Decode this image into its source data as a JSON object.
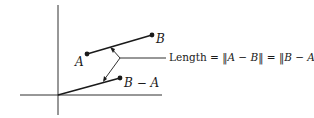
{
  "diagram": {
    "labels": {
      "point_a": "A",
      "point_b": "B",
      "difference": "B − A",
      "length_prefix": "Length = ",
      "norm_ab": "‖A − B‖",
      "equals": " = ",
      "norm_ba": "‖B − A‖"
    },
    "points": {
      "origin": [
        58,
        95
      ],
      "A": [
        87,
        54
      ],
      "B": [
        152,
        35
      ],
      "B_minus_A": [
        120,
        78
      ]
    },
    "colors": {
      "ink": "#1a1a1a",
      "background": "#ffffff"
    }
  }
}
